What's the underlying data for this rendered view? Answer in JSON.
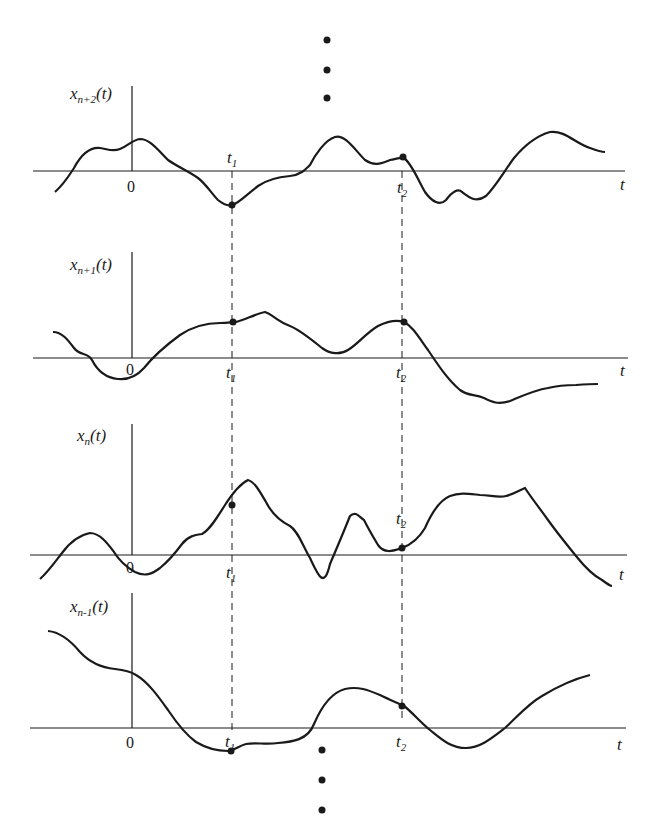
{
  "diagram": {
    "type": "ensemble-of-sample-functions",
    "ellipsis_top": "⋮",
    "ellipsis_bottom": "⋮",
    "time_markers": [
      "t1",
      "t2"
    ],
    "panels": [
      {
        "name": "x_{n+2}(t)",
        "label_main": "x",
        "label_sub": "n+2",
        "label_arg": "(t)",
        "origin": "0",
        "t1": "t",
        "t1_sub": "1",
        "t2": "t",
        "t2_sub": "2",
        "axis": "t"
      },
      {
        "name": "x_{n+1}(t)",
        "label_main": "x",
        "label_sub": "n+1",
        "label_arg": "(t)",
        "origin": "0",
        "t1": "t",
        "t1_sub": "1",
        "t2": "t",
        "t2_sub": "2",
        "axis": "t"
      },
      {
        "name": "x_n(t)",
        "label_main": "x",
        "label_sub": "n",
        "label_arg": "(t)",
        "origin": "0",
        "t1": "t",
        "t1_sub": "1",
        "t2": "t",
        "t2_sub": "2",
        "axis": "t"
      },
      {
        "name": "x_{n-1}(t)",
        "label_main": "x",
        "label_sub": "n-1",
        "label_arg": "(t)",
        "origin": "0",
        "t1": "t",
        "t1_sub": "1",
        "t2": "t",
        "t2_sub": "2",
        "axis": "t"
      }
    ]
  }
}
